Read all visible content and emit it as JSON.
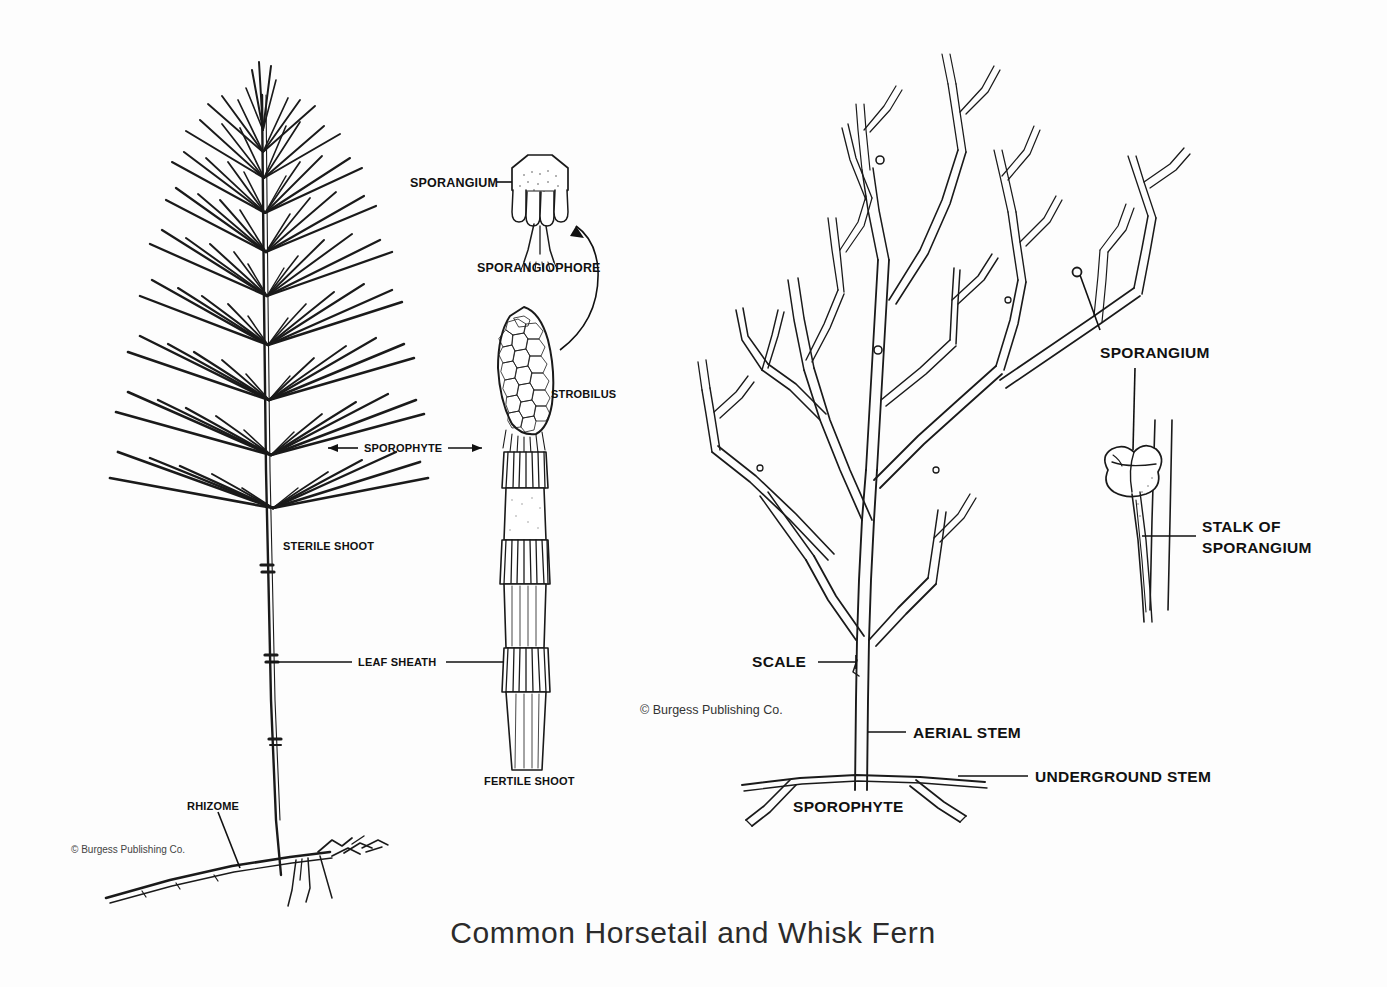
{
  "figure": {
    "title": "Common Horsetail and Whisk Fern",
    "background_color": "#fdfdfd",
    "ink_color": "#1a1a1a"
  },
  "horsetail": {
    "labels": {
      "sterile_shoot": "STERILE SHOOT",
      "fertile_shoot": "FERTILE SHOOT",
      "sporophyte": "SPOROPHYTE",
      "leaf_sheath": "LEAF SHEATH",
      "rhizome": "RHIZOME",
      "sporangium": "SPORANGIUM",
      "sporangiophore": "SPORANGIOPHORE",
      "strobilus": "STROBILUS"
    },
    "copyright": "© Burgess Publishing Co."
  },
  "whiskfern": {
    "labels": {
      "sporangium": "SPORANGIUM",
      "stalk_of_sporangium_line1": "STALK OF",
      "stalk_of_sporangium_line2": "SPORANGIUM",
      "scale": "SCALE",
      "aerial_stem": "AERIAL STEM",
      "underground_stem": "UNDERGROUND STEM",
      "sporophyte": "SPOROPHYTE"
    },
    "copyright": "© Burgess Publishing Co."
  }
}
